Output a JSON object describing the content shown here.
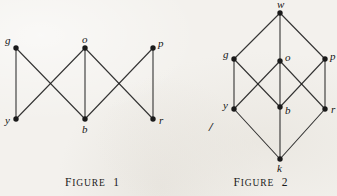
{
  "page": {
    "background_color": "#f3f1ed",
    "ink_color": "#1a1a1a",
    "width": 337,
    "height": 196
  },
  "figures": [
    {
      "id": "figure-1",
      "caption_small_caps": "IGURE",
      "caption_first_letter": "F",
      "caption_number": "1",
      "caption_text": "FIGURE 1",
      "nodes": [
        {
          "id": "g",
          "label": "g",
          "x": 16,
          "y": 48,
          "label_dx": -11,
          "label_dy": -13
        },
        {
          "id": "o",
          "label": "o",
          "x": 85,
          "y": 48,
          "label_dx": -3,
          "label_dy": -14
        },
        {
          "id": "p",
          "label": "p",
          "x": 153,
          "y": 48,
          "label_dx": 5,
          "label_dy": -10
        },
        {
          "id": "y",
          "label": "y",
          "x": 16,
          "y": 119,
          "label_dx": -11,
          "label_dy": -4
        },
        {
          "id": "b",
          "label": "b",
          "x": 85,
          "y": 119,
          "label_dx": -3,
          "label_dy": 5
        },
        {
          "id": "r",
          "label": "r",
          "x": 153,
          "y": 119,
          "label_dx": 6,
          "label_dy": -4
        }
      ],
      "edges": [
        {
          "from": "g",
          "to": "y"
        },
        {
          "from": "g",
          "to": "b"
        },
        {
          "from": "o",
          "to": "y"
        },
        {
          "from": "o",
          "to": "b"
        },
        {
          "from": "p",
          "to": "b"
        },
        {
          "from": "p",
          "to": "r"
        },
        {
          "from": "o",
          "to": "r"
        }
      ]
    },
    {
      "id": "figure-2",
      "caption_small_caps": "IGURE",
      "caption_first_letter": "F",
      "caption_number": "2",
      "caption_text": "FIGURE 2",
      "stray_mark": "/",
      "nodes": [
        {
          "id": "w",
          "label": "w",
          "x": 95,
          "y": 13,
          "label_dx": -3,
          "label_dy": -14
        },
        {
          "id": "g",
          "label": "g",
          "x": 49,
          "y": 59,
          "label_dx": -11,
          "label_dy": -10
        },
        {
          "id": "o",
          "label": "o",
          "x": 95,
          "y": 61,
          "label_dx": 5,
          "label_dy": -9
        },
        {
          "id": "p",
          "label": "p",
          "x": 140,
          "y": 59,
          "label_dx": 5,
          "label_dy": -8
        },
        {
          "id": "y",
          "label": "y",
          "x": 49,
          "y": 109,
          "label_dx": -11,
          "label_dy": -9
        },
        {
          "id": "b",
          "label": "b",
          "x": 95,
          "y": 107,
          "label_dx": 5,
          "label_dy": -2
        },
        {
          "id": "r",
          "label": "r",
          "x": 140,
          "y": 109,
          "label_dx": 6,
          "label_dy": -5
        },
        {
          "id": "k",
          "label": "k",
          "x": 95,
          "y": 159,
          "label_dx": -3,
          "label_dy": 4
        }
      ],
      "edges": [
        {
          "from": "w",
          "to": "g"
        },
        {
          "from": "w",
          "to": "o"
        },
        {
          "from": "w",
          "to": "p"
        },
        {
          "from": "g",
          "to": "y"
        },
        {
          "from": "g",
          "to": "b"
        },
        {
          "from": "o",
          "to": "y"
        },
        {
          "from": "o",
          "to": "b"
        },
        {
          "from": "p",
          "to": "b"
        },
        {
          "from": "p",
          "to": "r"
        },
        {
          "from": "o",
          "to": "r"
        },
        {
          "from": "y",
          "to": "k"
        },
        {
          "from": "b",
          "to": "k"
        },
        {
          "from": "r",
          "to": "k"
        }
      ]
    }
  ]
}
